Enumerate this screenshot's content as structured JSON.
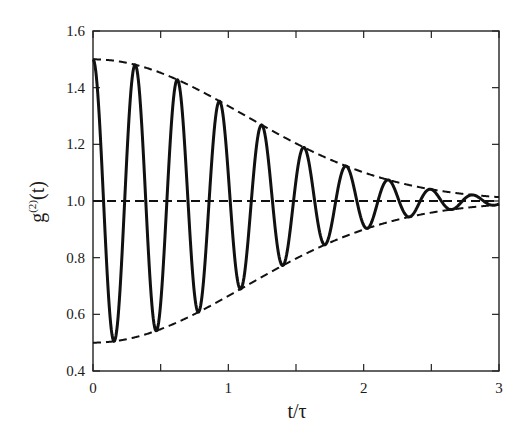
{
  "chart_data": {
    "type": "line",
    "title": "",
    "xlabel": "t/τ",
    "ylabel": "g(2)(t)",
    "ylabel_parts": {
      "base": "g",
      "sup": "(2)",
      "arg": "(t)"
    },
    "xlim": [
      0,
      3
    ],
    "ylim": [
      0.4,
      1.6
    ],
    "x_ticks": [
      0,
      0.5,
      1,
      1.5,
      2,
      2.5,
      3
    ],
    "x_tick_labels": [
      "0",
      "",
      "1",
      "",
      "2",
      "",
      "3"
    ],
    "y_ticks": [
      0.4,
      0.6,
      0.8,
      1.0,
      1.2,
      1.4,
      1.6
    ],
    "y_tick_labels": [
      "0.4",
      "0.6",
      "0.8",
      "1.0",
      "1.2",
      "1.4",
      "1.6"
    ],
    "grid": false,
    "legend": null,
    "series": [
      {
        "name": "g2 oscillation",
        "style": "solid",
        "model": "1 + 0.5*exp(-0.4*t^2)*cos(20.14*t)",
        "params": {
          "baseline": 1.0,
          "amplitude": 0.5,
          "decay": 0.4,
          "omega": 20.14
        },
        "extrema": [
          [
            0.0,
            1.5
          ],
          [
            0.156,
            0.505
          ],
          [
            0.312,
            1.481
          ],
          [
            0.468,
            0.542
          ],
          [
            0.624,
            1.428
          ],
          [
            0.78,
            0.608
          ],
          [
            0.936,
            1.352
          ],
          [
            1.092,
            0.69
          ],
          [
            1.248,
            1.269
          ],
          [
            1.404,
            0.775
          ],
          [
            1.56,
            1.189
          ],
          [
            1.716,
            0.846
          ],
          [
            1.872,
            1.123
          ],
          [
            2.028,
            0.901
          ],
          [
            2.184,
            1.074
          ],
          [
            2.34,
            0.939
          ],
          [
            2.496,
            1.041
          ],
          [
            2.652,
            0.967
          ],
          [
            2.808,
            1.021
          ],
          [
            2.964,
            0.985
          ]
        ]
      },
      {
        "name": "upper envelope",
        "style": "dashed",
        "model": "1 + 0.5*exp(-0.4*t^2)",
        "x": [
          0,
          0.5,
          1.0,
          1.5,
          2.0,
          2.5,
          3.0
        ],
        "values": [
          1.5,
          1.452,
          1.335,
          1.203,
          1.101,
          1.041,
          1.014
        ]
      },
      {
        "name": "lower envelope",
        "style": "dashed",
        "model": "1 - 0.5*exp(-0.4*t^2)",
        "x": [
          0,
          0.5,
          1.0,
          1.5,
          2.0,
          2.5,
          3.0
        ],
        "values": [
          0.5,
          0.548,
          0.665,
          0.797,
          0.899,
          0.959,
          0.986
        ]
      },
      {
        "name": "baseline",
        "style": "dashed",
        "x": [
          0,
          3
        ],
        "values": [
          1.0,
          1.0
        ]
      }
    ],
    "colors": {
      "line": "#111111",
      "axis": "#222222",
      "background": "#ffffff"
    }
  }
}
